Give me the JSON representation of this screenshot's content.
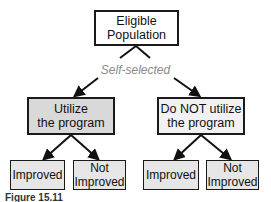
{
  "diagram": {
    "root": {
      "line1": "Eligible",
      "line2": "Population"
    },
    "edge_label": "Self-selected",
    "left": {
      "line1": "Utilize",
      "line2": "the program"
    },
    "right": {
      "line1": "Do NOT utilize",
      "line2": "the program"
    },
    "leaves": [
      {
        "line1": "Improved",
        "line2": ""
      },
      {
        "line1": "Not",
        "line2": "Improved"
      },
      {
        "line1": "Improved",
        "line2": ""
      },
      {
        "line1": "Not",
        "line2": "Improved"
      }
    ],
    "colors": {
      "left_fill": "#d9d9d9",
      "right_fill": "#f1f1f1",
      "leaf_fill": "#e6e6e6",
      "border": "#1a1a1a"
    }
  },
  "caption": "Figure 15.11"
}
